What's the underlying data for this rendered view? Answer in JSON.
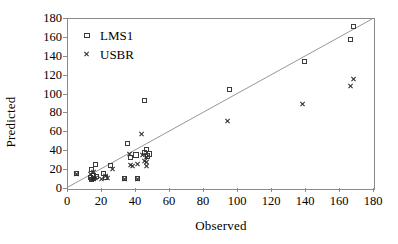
{
  "chart_data": {
    "type": "scatter",
    "title": "",
    "xlabel": "Observed",
    "ylabel": "Predicted",
    "xlim": [
      0,
      180
    ],
    "ylim": [
      0,
      180
    ],
    "xticks": [
      0,
      20,
      40,
      60,
      80,
      100,
      120,
      140,
      160,
      180
    ],
    "yticks": [
      0,
      20,
      40,
      60,
      80,
      100,
      120,
      140,
      160,
      180
    ],
    "grid": false,
    "legend_position": "upper-left",
    "reference_line": {
      "name": "one-to-one-line",
      "type": "line",
      "x": [
        0,
        180
      ],
      "y": [
        0,
        180
      ],
      "color": "#8a8a8a"
    },
    "series": [
      {
        "name": "LMS1",
        "marker": "square-open",
        "color": "#3b3b3b",
        "points": [
          [
            5,
            16
          ],
          [
            13,
            12
          ],
          [
            14,
            10
          ],
          [
            14,
            21
          ],
          [
            15,
            14
          ],
          [
            15,
            11
          ],
          [
            16,
            26
          ],
          [
            17,
            13
          ],
          [
            21,
            16
          ],
          [
            22,
            12
          ],
          [
            25,
            25
          ],
          [
            33,
            11
          ],
          [
            35,
            48
          ],
          [
            37,
            33
          ],
          [
            40,
            36
          ],
          [
            41,
            11
          ],
          [
            45,
            94
          ],
          [
            45,
            39
          ],
          [
            46,
            42
          ],
          [
            47,
            35
          ],
          [
            48,
            37
          ],
          [
            95,
            105
          ],
          [
            139,
            135
          ],
          [
            166,
            158
          ],
          [
            168,
            172
          ]
        ]
      },
      {
        "name": "USBR",
        "marker": "cross-x",
        "color": "#2b2b2b",
        "points": [
          [
            5,
            16
          ],
          [
            13,
            16
          ],
          [
            14,
            10
          ],
          [
            15,
            11
          ],
          [
            15,
            18
          ],
          [
            16,
            12
          ],
          [
            20,
            11
          ],
          [
            22,
            14
          ],
          [
            23,
            12
          ],
          [
            26,
            21
          ],
          [
            33,
            11
          ],
          [
            36,
            37
          ],
          [
            37,
            25
          ],
          [
            38,
            24
          ],
          [
            41,
            26
          ],
          [
            41,
            11
          ],
          [
            43,
            58
          ],
          [
            44,
            36
          ],
          [
            45,
            30
          ],
          [
            46,
            34
          ],
          [
            46,
            28
          ],
          [
            46,
            24
          ],
          [
            94,
            72
          ],
          [
            138,
            90
          ],
          [
            166,
            109
          ],
          [
            168,
            116
          ]
        ]
      }
    ]
  }
}
